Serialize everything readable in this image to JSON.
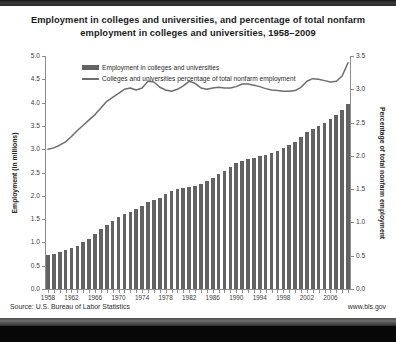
{
  "chart_data": {
    "type": "bar",
    "title": "Employment in colleges and universities, and percentage of total nonfarm employment in colleges and universities, 1958–2009",
    "title_line1": "Employment in colleges and universities, and percentage of total nonfarm",
    "title_line2": "employment in colleges and universities, 1958–2009",
    "xlabel": "",
    "ylabel": "Employment (in millions)",
    "y2label": "Percentage of total nonfarm employment",
    "ylim": [
      0.0,
      5.0
    ],
    "y2lim": [
      0.0,
      3.5
    ],
    "grid": false,
    "legend_position": "top-left-inside",
    "y_ticks": [
      "0.0",
      "0.5",
      "1.0",
      "1.5",
      "2.0",
      "2.5",
      "3.0",
      "3.5",
      "4.0",
      "4.5",
      "5.0"
    ],
    "y2_ticks": [
      "0.0",
      "0.5",
      "1.0",
      "1.5",
      "2.0",
      "2.5",
      "3.0",
      "3.5"
    ],
    "x_tick_labels": [
      "1958",
      "1962",
      "1966",
      "1970",
      "1974",
      "1978",
      "1982",
      "1986",
      "1990",
      "1994",
      "1998",
      "2002",
      "2006"
    ],
    "x": [
      1958,
      1959,
      1960,
      1961,
      1962,
      1963,
      1964,
      1965,
      1966,
      1967,
      1968,
      1969,
      1970,
      1971,
      1972,
      1973,
      1974,
      1975,
      1976,
      1977,
      1978,
      1979,
      1980,
      1981,
      1982,
      1983,
      1984,
      1985,
      1986,
      1987,
      1988,
      1989,
      1990,
      1991,
      1992,
      1993,
      1994,
      1995,
      1996,
      1997,
      1998,
      1999,
      2000,
      2001,
      2002,
      2003,
      2004,
      2005,
      2006,
      2007,
      2008,
      2009
    ],
    "series": [
      {
        "name": "Employment in colleges and universities",
        "type": "bar",
        "axis": "left",
        "units": "millions",
        "color": "#636363",
        "values": [
          0.72,
          0.76,
          0.8,
          0.83,
          0.88,
          0.93,
          1.0,
          1.08,
          1.18,
          1.28,
          1.38,
          1.47,
          1.55,
          1.6,
          1.66,
          1.71,
          1.79,
          1.87,
          1.92,
          1.96,
          2.04,
          2.1,
          2.15,
          2.17,
          2.18,
          2.21,
          2.26,
          2.32,
          2.39,
          2.46,
          2.54,
          2.62,
          2.7,
          2.75,
          2.78,
          2.81,
          2.85,
          2.88,
          2.92,
          2.97,
          3.02,
          3.08,
          3.15,
          3.26,
          3.38,
          3.44,
          3.5,
          3.57,
          3.65,
          3.74,
          3.85,
          3.96
        ]
      },
      {
        "name": "Colleges and universities percentage of total nonfarm employment",
        "type": "line",
        "axis": "right",
        "units": "percent",
        "color": "#6e6e6e",
        "values": [
          2.1,
          2.12,
          2.16,
          2.21,
          2.29,
          2.38,
          2.46,
          2.54,
          2.62,
          2.72,
          2.82,
          2.88,
          2.94,
          3.0,
          3.02,
          2.99,
          3.02,
          3.12,
          3.11,
          3.03,
          2.99,
          2.97,
          3.0,
          3.05,
          3.12,
          3.09,
          3.02,
          3.0,
          3.02,
          3.03,
          3.02,
          3.02,
          3.04,
          3.08,
          3.08,
          3.06,
          3.04,
          3.01,
          2.99,
          2.98,
          2.97,
          2.97,
          2.98,
          3.03,
          3.12,
          3.16,
          3.15,
          3.13,
          3.11,
          3.12,
          3.2,
          3.4
        ]
      }
    ],
    "legend": [
      {
        "label": "Employment in colleges and universities",
        "marker": "bar",
        "color": "#636363"
      },
      {
        "label": "Colleges and universities percentage of total nonfarm employment",
        "marker": "line",
        "color": "#6e6e6e"
      }
    ],
    "source": "Source: U.S. Bureau of Labor Statistics",
    "url": "www.bls.gov"
  },
  "colors": {
    "bar": "#636363",
    "line": "#6e6e6e",
    "axis": "#8d8d8d",
    "text": "#2b2b2b",
    "background": "#ffffff"
  }
}
